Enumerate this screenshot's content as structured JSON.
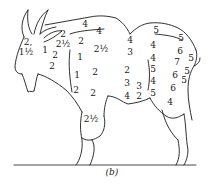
{
  "figure": {
    "caption": "(b)",
    "line_color": "#1a1a1a",
    "background": "#ffffff"
  },
  "labels": [
    {
      "text": "2,",
      "x": 28,
      "y": 42,
      "region": "head"
    },
    {
      "text": "1½",
      "x": 26,
      "y": 52,
      "region": "head"
    },
    {
      "text": "1",
      "x": 45,
      "y": 50,
      "region": "neck"
    },
    {
      "text": "2",
      "x": 55,
      "y": 55,
      "region": "neck"
    },
    {
      "text": "2",
      "x": 52,
      "y": 66,
      "region": "neck"
    },
    {
      "text": "2",
      "x": 63,
      "y": 34,
      "region": "withers"
    },
    {
      "text": "4",
      "x": 85,
      "y": 24,
      "region": "back"
    },
    {
      "text": "4",
      "x": 99,
      "y": 31,
      "region": "back"
    },
    {
      "text": "2½",
      "x": 63,
      "y": 44,
      "region": "shoulder"
    },
    {
      "text": "2",
      "x": 81,
      "y": 41,
      "region": "shoulder"
    },
    {
      "text": "2½",
      "x": 101,
      "y": 49,
      "region": "shoulder"
    },
    {
      "text": "1",
      "x": 80,
      "y": 57,
      "region": "shoulder"
    },
    {
      "text": "1",
      "x": 77,
      "y": 75,
      "region": "foreleg"
    },
    {
      "text": "2",
      "x": 95,
      "y": 72,
      "region": "chest"
    },
    {
      "text": "2",
      "x": 76,
      "y": 90,
      "region": "foreleg"
    },
    {
      "text": "2",
      "x": 93,
      "y": 93,
      "region": "chest"
    },
    {
      "text": "4",
      "x": 130,
      "y": 40,
      "region": "side"
    },
    {
      "text": "3",
      "x": 130,
      "y": 52,
      "region": "side"
    },
    {
      "text": "2",
      "x": 127,
      "y": 70,
      "region": "side"
    },
    {
      "text": "3",
      "x": 127,
      "y": 83,
      "region": "side"
    },
    {
      "text": "4",
      "x": 127,
      "y": 96,
      "region": "belly"
    },
    {
      "text": "3",
      "x": 139,
      "y": 86,
      "region": "belly"
    },
    {
      "text": "2",
      "x": 139,
      "y": 96,
      "region": "belly"
    },
    {
      "text": "5",
      "x": 156,
      "y": 30,
      "region": "rump"
    },
    {
      "text": "4",
      "x": 153,
      "y": 45,
      "region": "flank"
    },
    {
      "text": "4",
      "x": 153,
      "y": 58,
      "region": "flank"
    },
    {
      "text": "5",
      "x": 153,
      "y": 69,
      "region": "flank"
    },
    {
      "text": "4",
      "x": 153,
      "y": 81,
      "region": "flank"
    },
    {
      "text": "5",
      "x": 153,
      "y": 93,
      "region": "flank"
    },
    {
      "text": "5",
      "x": 181,
      "y": 38,
      "region": "rump"
    },
    {
      "text": "6",
      "x": 180,
      "y": 51,
      "region": "haunch"
    },
    {
      "text": "7",
      "x": 177,
      "y": 62,
      "region": "haunch"
    },
    {
      "text": "5",
      "x": 191,
      "y": 58,
      "region": "tail"
    },
    {
      "text": "6",
      "x": 175,
      "y": 75,
      "region": "haunch"
    },
    {
      "text": "5",
      "x": 187,
      "y": 71,
      "region": "haunch"
    },
    {
      "text": "5",
      "x": 184,
      "y": 80,
      "region": "haunch"
    },
    {
      "text": "6",
      "x": 173,
      "y": 88,
      "region": "thigh"
    },
    {
      "text": "4",
      "x": 170,
      "y": 102,
      "region": "hindleg"
    },
    {
      "text": "2½",
      "x": 91,
      "y": 119,
      "region": "foreleg-lower"
    }
  ]
}
